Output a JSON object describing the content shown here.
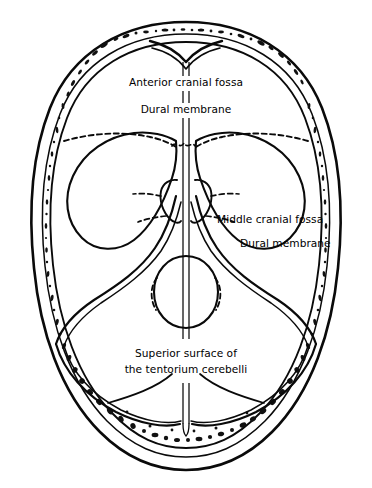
{
  "figure": {
    "background_color": "#ffffff",
    "ink_color": "#0a0a0a",
    "width": 372,
    "height": 488
  },
  "labels": {
    "anterior_cranial_fossa": "Anterior cranial fossa",
    "dural_membrane_top": "Dural membrane",
    "middle_cranial_fossa": "Middle cranial fossa",
    "dural_membrane_right": "Dural membrane",
    "tentorium_line1": "Superior surface of",
    "tentorium_line2": "the tentorium cerebelli"
  },
  "structures": [
    {
      "name": "skull-bone-wall",
      "description": "double-contour cranial vault wall with diploe stippling"
    },
    {
      "name": "frontal-crest-notch",
      "description": "anterior midline V notch"
    },
    {
      "name": "falx-midline",
      "description": "vertical midline double line"
    },
    {
      "name": "anterior-cranial-fossa-left",
      "description": "left anterior fossa lobe"
    },
    {
      "name": "anterior-cranial-fossa-right",
      "description": "right anterior fossa lobe"
    },
    {
      "name": "middle-cranial-fossa-left",
      "description": "left middle fossa sweep"
    },
    {
      "name": "middle-cranial-fossa-right",
      "description": "right middle fossa sweep"
    },
    {
      "name": "sella-foramen-oval",
      "description": "central oval with dashed lateral margins"
    },
    {
      "name": "cribriform-dashed-margin",
      "description": "horizontal dashed plate margin"
    },
    {
      "name": "tentorium-cerebelli",
      "description": "posterior tentorial surface curves"
    }
  ]
}
